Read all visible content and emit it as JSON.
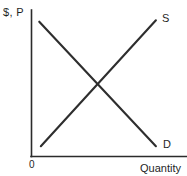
{
  "chart_data": {
    "type": "line",
    "title": "",
    "subtitle": "",
    "xlabel": "Quantity",
    "ylabel": "$, P",
    "origin_label": "0",
    "grid": false,
    "legend_position": "inline-curve-end",
    "axis_color": "#2b2b2b",
    "curve_color": "#2e2e2e",
    "background_color": "#ffffff",
    "xlim": [
      0,
      1
    ],
    "ylim": [
      0,
      1
    ],
    "series": [
      {
        "name": "D",
        "label": "D",
        "description": "Demand curve, downward sloping",
        "x": [
          0.05,
          0.8
        ],
        "y": [
          0.92,
          0.07
        ],
        "color": "#2e2e2e"
      },
      {
        "name": "S",
        "label": "S",
        "description": "Supply curve, upward sloping",
        "x": [
          0.06,
          0.8
        ],
        "y": [
          0.07,
          0.93
        ],
        "color": "#2e2e2e"
      }
    ],
    "annotations": [
      {
        "name": "equilibrium",
        "description": "Intersection of supply and demand",
        "x": 0.43,
        "y": 0.49,
        "text": ""
      }
    ]
  },
  "labels": {
    "y_axis": "$, P",
    "x_axis": "Quantity",
    "origin": "0",
    "supply": "S",
    "demand": "D"
  }
}
